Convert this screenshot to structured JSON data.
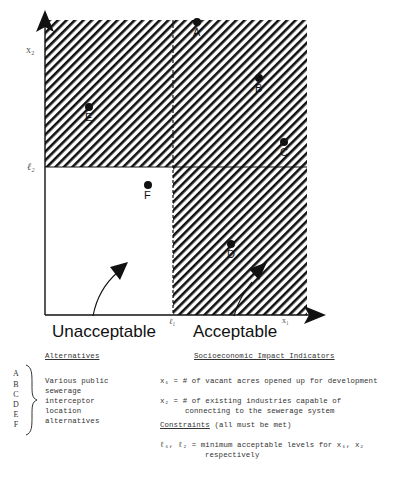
{
  "diagram": {
    "axes": {
      "x_label": "x₁",
      "y_label": "x₂",
      "x_threshold_label": "ℓ₁",
      "y_threshold_label": "ℓ₂"
    },
    "regions": {
      "unacceptable_label": "Unacceptable",
      "acceptable_label": "Acceptable"
    },
    "points": [
      {
        "label": "A",
        "x": 197,
        "y": 22
      },
      {
        "label": "B",
        "x": 259,
        "y": 78
      },
      {
        "label": "C",
        "x": 284,
        "y": 142
      },
      {
        "label": "D",
        "x": 231,
        "y": 244
      },
      {
        "label": "E",
        "x": 89,
        "y": 107
      },
      {
        "label": "F",
        "x": 148,
        "y": 185
      }
    ],
    "colors": {
      "ink": "#111111",
      "background": "#ffffff"
    }
  },
  "legend": {
    "alternatives_heading": "Alternatives",
    "alternative_letters": [
      "A",
      "B",
      "C",
      "D",
      "E",
      "F"
    ],
    "alternatives_description": [
      "Various public",
      "sewerage",
      "interceptor",
      "location",
      "alternatives"
    ],
    "indicators_heading": "Socioeconomic Impact Indicators",
    "x1_def": "x₁ = # of vacant acres opened up for development",
    "x2_def_line1": "x₂ = # of existing industries capable of",
    "x2_def_line2": "connecting to the sewerage system",
    "constraints_heading": "Constraints",
    "constraints_note": " (all must be met)",
    "threshold_def_line1": "ℓ₁, ℓ₂ = minimum acceptable levels for x₁, x₂",
    "threshold_def_line2": "respectively"
  }
}
